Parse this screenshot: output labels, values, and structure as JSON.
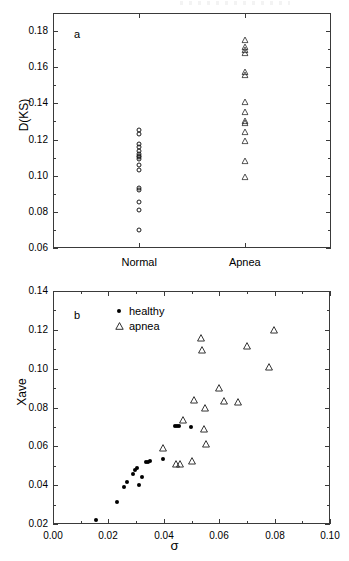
{
  "figure": {
    "background_color": "#ffffff",
    "axis_color": "#3a3a3a",
    "marker_color": "#1a1a1a"
  },
  "chart_data": [
    {
      "type": "scatter",
      "panel": "a",
      "panel_label": "a",
      "title": "",
      "xlabel": "",
      "ylabel": "D(KS)",
      "xlim": [
        0,
        2
      ],
      "ylim": [
        0.06,
        0.19
      ],
      "ytick_values": [
        0.06,
        0.08,
        0.1,
        0.12,
        0.14,
        0.16,
        0.18
      ],
      "ytick_labels": [
        "0.06",
        "0.08",
        "0.10",
        "0.12",
        "0.14",
        "0.16",
        "0.18"
      ],
      "yminor_values": [
        0.07,
        0.09,
        0.11,
        0.13,
        0.15,
        0.17
      ],
      "categories": [
        "Normal",
        "Apnea"
      ],
      "category_positions": [
        0.62,
        1.38
      ],
      "grid": false,
      "legend": "none",
      "series": [
        {
          "name": "Normal",
          "marker": "open-circle",
          "x_category": 0.62,
          "values": [
            0.1255,
            0.123,
            0.1175,
            0.116,
            0.1135,
            0.112,
            0.111,
            0.1105,
            0.1095,
            0.106,
            0.103,
            0.093,
            0.092,
            0.0855,
            0.081,
            0.07
          ]
        },
        {
          "name": "Apnea",
          "marker": "open-triangle",
          "x_category": 1.38,
          "values": [
            0.175,
            0.171,
            0.1695,
            0.168,
            0.1575,
            0.1555,
            0.141,
            0.1355,
            0.1305,
            0.129,
            0.124,
            0.119,
            0.108,
            0.0995
          ]
        }
      ]
    },
    {
      "type": "scatter",
      "panel": "b",
      "panel_label": "b",
      "title": "",
      "xlabel": "σ",
      "ylabel": "Xave",
      "xlim": [
        0.0,
        0.1
      ],
      "ylim": [
        0.02,
        0.14
      ],
      "xtick_values": [
        0.0,
        0.02,
        0.04,
        0.06,
        0.08,
        0.1
      ],
      "xtick_labels": [
        "0.00",
        "0.02",
        "0.04",
        "0.06",
        "0.08",
        "0.10"
      ],
      "xminor_values": [
        0.01,
        0.03,
        0.05,
        0.07,
        0.09
      ],
      "ytick_values": [
        0.02,
        0.04,
        0.06,
        0.08,
        0.1,
        0.12,
        0.14
      ],
      "ytick_labels": [
        "0.02",
        "0.04",
        "0.06",
        "0.08",
        "0.10",
        "0.12",
        "0.14"
      ],
      "yminor_values": [
        0.03,
        0.05,
        0.07,
        0.09,
        0.11,
        0.13
      ],
      "grid": false,
      "legend": "top-left-inside",
      "series": [
        {
          "name": "healthy",
          "marker": "filled-dot",
          "points": [
            [
              0.0157,
              0.0221
            ],
            [
              0.0232,
              0.0312
            ],
            [
              0.0258,
              0.0391
            ],
            [
              0.0268,
              0.0418
            ],
            [
              0.0288,
              0.0457
            ],
            [
              0.0296,
              0.048
            ],
            [
              0.0305,
              0.0487
            ],
            [
              0.0311,
              0.0399
            ],
            [
              0.0322,
              0.0443
            ],
            [
              0.0336,
              0.0519
            ],
            [
              0.0343,
              0.0521
            ],
            [
              0.0349,
              0.0524
            ],
            [
              0.0396,
              0.0533
            ],
            [
              0.0442,
              0.0703
            ],
            [
              0.0449,
              0.0704
            ],
            [
              0.0456,
              0.0704
            ],
            [
              0.0497,
              0.07
            ]
          ]
        },
        {
          "name": "apnea",
          "marker": "open-triangle",
          "points": [
            [
              0.0396,
              0.0589
            ],
            [
              0.0443,
              0.051
            ],
            [
              0.0457,
              0.0508
            ],
            [
              0.047,
              0.0735
            ],
            [
              0.0503,
              0.0523
            ],
            [
              0.051,
              0.0838
            ],
            [
              0.0535,
              0.116
            ],
            [
              0.0538,
              0.1098
            ],
            [
              0.0544,
              0.069
            ],
            [
              0.0548,
              0.0798
            ],
            [
              0.0551,
              0.0614
            ],
            [
              0.06,
              0.0899
            ],
            [
              0.0618,
              0.0836
            ],
            [
              0.0668,
              0.0829
            ],
            [
              0.07,
              0.1117
            ],
            [
              0.0779,
              0.101
            ],
            [
              0.0799,
              0.12
            ]
          ]
        }
      ]
    }
  ]
}
